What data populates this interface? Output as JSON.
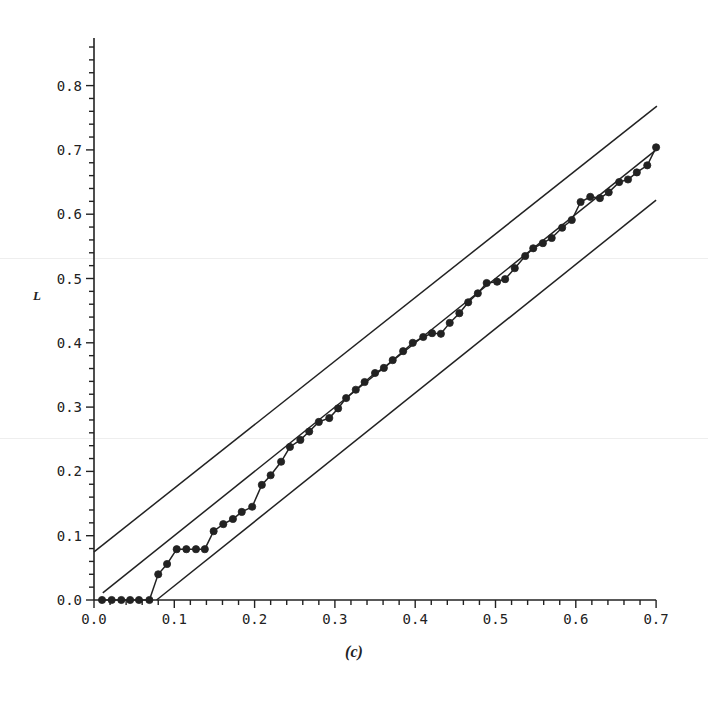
{
  "chart_data": {
    "type": "line",
    "title": "",
    "caption": "(c)",
    "xlabel": "",
    "ylabel": "L",
    "xlim": [
      0.0,
      0.7
    ],
    "ylim": [
      0.0,
      0.87
    ],
    "x_ticks": [
      "0.0",
      "0.1",
      "0.2",
      "0.3",
      "0.4",
      "0.5",
      "0.6",
      "0.7"
    ],
    "y_ticks": [
      "0.0",
      "0.1",
      "0.2",
      "0.3",
      "0.4",
      "0.5",
      "0.6",
      "0.7",
      "0.8"
    ],
    "minor_tick_step": 0.02,
    "grid": false,
    "legend": null,
    "series": [
      {
        "name": "observed",
        "style": "line-with-markers",
        "points": [
          [
            0.01,
            0.0
          ],
          [
            0.022,
            0.0
          ],
          [
            0.034,
            0.0
          ],
          [
            0.045,
            0.0
          ],
          [
            0.056,
            0.0
          ],
          [
            0.069,
            0.0
          ],
          [
            0.08,
            0.04
          ],
          [
            0.091,
            0.056
          ],
          [
            0.103,
            0.079
          ],
          [
            0.115,
            0.079
          ],
          [
            0.127,
            0.079
          ],
          [
            0.138,
            0.079
          ],
          [
            0.149,
            0.107
          ],
          [
            0.161,
            0.118
          ],
          [
            0.173,
            0.126
          ],
          [
            0.184,
            0.137
          ],
          [
            0.197,
            0.145
          ],
          [
            0.209,
            0.179
          ],
          [
            0.22,
            0.194
          ],
          [
            0.233,
            0.215
          ],
          [
            0.244,
            0.238
          ],
          [
            0.257,
            0.249
          ],
          [
            0.268,
            0.262
          ],
          [
            0.28,
            0.277
          ],
          [
            0.293,
            0.283
          ],
          [
            0.304,
            0.298
          ],
          [
            0.314,
            0.314
          ],
          [
            0.326,
            0.327
          ],
          [
            0.337,
            0.339
          ],
          [
            0.35,
            0.353
          ],
          [
            0.361,
            0.361
          ],
          [
            0.372,
            0.373
          ],
          [
            0.385,
            0.387
          ],
          [
            0.397,
            0.4
          ],
          [
            0.41,
            0.409
          ],
          [
            0.421,
            0.415
          ],
          [
            0.432,
            0.414
          ],
          [
            0.443,
            0.431
          ],
          [
            0.455,
            0.446
          ],
          [
            0.466,
            0.463
          ],
          [
            0.478,
            0.477
          ],
          [
            0.489,
            0.493
          ],
          [
            0.502,
            0.495
          ],
          [
            0.512,
            0.499
          ],
          [
            0.524,
            0.516
          ],
          [
            0.537,
            0.535
          ],
          [
            0.547,
            0.547
          ],
          [
            0.559,
            0.555
          ],
          [
            0.57,
            0.563
          ],
          [
            0.583,
            0.579
          ],
          [
            0.595,
            0.591
          ],
          [
            0.606,
            0.619
          ],
          [
            0.618,
            0.627
          ],
          [
            0.63,
            0.625
          ],
          [
            0.641,
            0.634
          ],
          [
            0.654,
            0.65
          ],
          [
            0.665,
            0.654
          ],
          [
            0.676,
            0.665
          ],
          [
            0.689,
            0.676
          ],
          [
            0.7,
            0.704
          ]
        ]
      },
      {
        "name": "reference y=x",
        "style": "line",
        "points": [
          [
            0.011,
            0.011
          ],
          [
            0.7,
            0.7
          ]
        ]
      },
      {
        "name": "upper band",
        "style": "line",
        "points": [
          [
            0.0,
            0.075
          ],
          [
            0.701,
            0.768
          ]
        ]
      },
      {
        "name": "lower band",
        "style": "line",
        "points": [
          [
            0.078,
            0.0
          ],
          [
            0.7,
            0.622
          ]
        ]
      }
    ]
  },
  "colors": {
    "ink": "#222222",
    "background": "#ffffff"
  }
}
